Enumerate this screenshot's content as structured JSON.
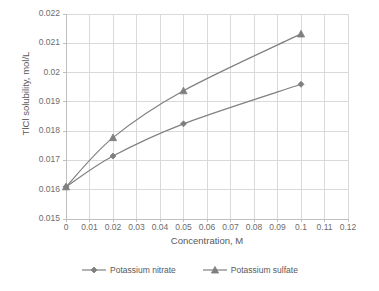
{
  "chart_data": {
    "type": "line",
    "title": "",
    "xlabel": "Concentration, M",
    "ylabel": "TlCl solubility, mol/L",
    "xlim": [
      0,
      0.12
    ],
    "ylim": [
      0.015,
      0.022
    ],
    "grid": true,
    "legend_position": "bottom",
    "xticks": [
      "0",
      "0.01",
      "0.02",
      "0.03",
      "0.04",
      "0.05",
      "0.06",
      "0.07",
      "0.08",
      "0.09",
      "0.1",
      "0.11",
      "0.12"
    ],
    "xtick_values": [
      0,
      0.01,
      0.02,
      0.03,
      0.04,
      0.05,
      0.06,
      0.07,
      0.08,
      0.09,
      0.1,
      0.11,
      0.12
    ],
    "yticks": [
      "0.015",
      "0.016",
      "0.017",
      "0.018",
      "0.019",
      "0.02",
      "0.021",
      "0.022"
    ],
    "ytick_values": [
      0.015,
      0.016,
      0.017,
      0.018,
      0.019,
      0.02,
      0.021,
      0.022
    ],
    "x": [
      0,
      0.02,
      0.05,
      0.1
    ],
    "series": [
      {
        "name": "Potassium nitrate",
        "marker": "diamond",
        "color": "#808080",
        "values": [
          0.0161,
          0.01715,
          0.01825,
          0.0196
        ]
      },
      {
        "name": "Potassium sulfate",
        "marker": "triangle",
        "color": "#808080",
        "values": [
          0.0161,
          0.01778,
          0.01938,
          0.02132
        ]
      }
    ]
  },
  "colors": {
    "line": "#808080",
    "marker": "#7f7f7f",
    "grid": "#d9d9d9",
    "axis": "#bfbfbf",
    "text": "#595959"
  },
  "legend": {
    "items": [
      {
        "label": "Potassium nitrate"
      },
      {
        "label": "Potassium sulfate"
      }
    ]
  }
}
